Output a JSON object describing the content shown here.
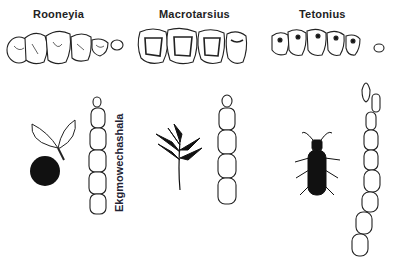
{
  "figure": {
    "panels": [
      {
        "genus": "Rooneyia",
        "diet_icon": "fruit-icon"
      },
      {
        "genus": "Macrotarsius",
        "diet_icon": "leaf-icon"
      },
      {
        "genus": "Tetonius",
        "diet_icon": "insect-icon"
      }
    ],
    "vertical_label": "Ekgmowechashala"
  }
}
